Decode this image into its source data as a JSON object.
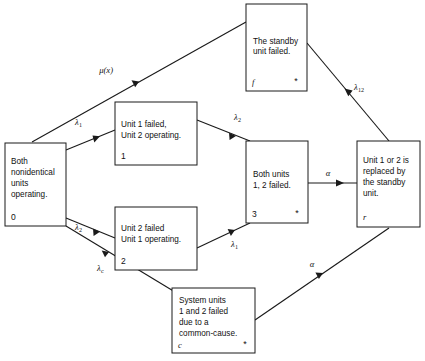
{
  "diagram": {
    "type": "state-transition-diagram",
    "states": [
      {
        "key": "state0",
        "id": "0",
        "id_style": "number",
        "star": "",
        "lines": [
          "Both",
          "nonidentical",
          "units",
          "operating."
        ]
      },
      {
        "key": "state1",
        "id": "1",
        "id_style": "number",
        "star": "",
        "lines": [
          "Unit 1 failed,",
          "Unit 2 operating."
        ]
      },
      {
        "key": "state2",
        "id": "2",
        "id_style": "number",
        "star": "",
        "lines": [
          "Unit 2 failed",
          "Unit 1 operating."
        ]
      },
      {
        "key": "state3",
        "id": "3",
        "id_style": "number",
        "star": "*",
        "lines": [
          "Both units",
          "1, 2 failed."
        ]
      },
      {
        "key": "statef",
        "id": "f",
        "id_style": "italic",
        "star": "*",
        "lines": [
          "The standby",
          "unit failed."
        ]
      },
      {
        "key": "stater",
        "id": "r",
        "id_style": "italic",
        "star": "",
        "lines": [
          "Unit 1 or 2 is",
          "replaced by",
          "the standby",
          "unit."
        ]
      },
      {
        "key": "statec",
        "id": "c",
        "id_style": "italic",
        "star": "*",
        "lines": [
          "System units",
          "1 and 2 failed",
          "due to a",
          "common-cause."
        ]
      }
    ],
    "transitions": [
      {
        "key": "t_f_0",
        "from": "f",
        "to": "0",
        "base": "μ(x)",
        "sub": "",
        "label": "μ(x)"
      },
      {
        "key": "t_0_1",
        "from": "0",
        "to": "1",
        "base": "λ",
        "sub": "1",
        "label": "λ1"
      },
      {
        "key": "t_1_3",
        "from": "1",
        "to": "3",
        "base": "λ",
        "sub": "2",
        "label": "λ2"
      },
      {
        "key": "t_0_2",
        "from": "0",
        "to": "2",
        "base": "λ",
        "sub": "2",
        "label": "λ2"
      },
      {
        "key": "t_2_3",
        "from": "2",
        "to": "3",
        "base": "λ",
        "sub": "1",
        "label": "λ1"
      },
      {
        "key": "t_0_c",
        "from": "0",
        "to": "c",
        "base": "λ",
        "sub": "c",
        "label": "λc"
      },
      {
        "key": "t_3_r",
        "from": "3",
        "to": "r",
        "base": "α",
        "sub": "",
        "label": "α"
      },
      {
        "key": "t_c_r",
        "from": "c",
        "to": "r",
        "base": "α",
        "sub": "",
        "label": "α"
      },
      {
        "key": "t_r_f",
        "from": "r",
        "to": "f",
        "base": "λ",
        "sub": "12",
        "label": "λ12"
      }
    ],
    "colors": {
      "stroke": "#1a1a1a",
      "background": "#ffffff",
      "text": "#111111"
    }
  }
}
